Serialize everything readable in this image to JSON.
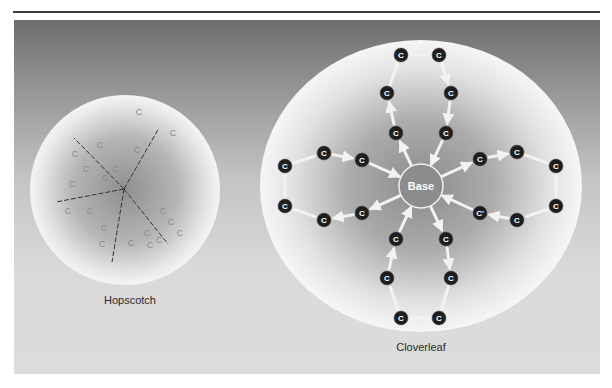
{
  "figure": {
    "panels": [
      {
        "id": "hopscotch",
        "label": "Hopscotch",
        "center": [
          125,
          190
        ],
        "radius": 95,
        "hub": [
          124,
          189
        ],
        "spokes": [
          [
            74,
            138
          ],
          [
            159,
            128
          ],
          [
            56,
            202
          ],
          [
            112,
            262
          ],
          [
            168,
            244
          ]
        ],
        "nodes": [
          {
            "x": 139,
            "y": 112,
            "t": "C"
          },
          {
            "x": 173,
            "y": 133,
            "t": "C"
          },
          {
            "x": 100,
            "y": 145,
            "t": "C"
          },
          {
            "x": 75,
            "y": 154,
            "t": "C"
          },
          {
            "x": 137,
            "y": 150,
            "t": "C"
          },
          {
            "x": 116,
            "y": 169,
            "t": "C"
          },
          {
            "x": 86,
            "y": 169,
            "t": "C"
          },
          {
            "x": 72,
            "y": 184,
            "t": "C"
          },
          {
            "x": 105,
            "y": 178,
            "t": "C"
          },
          {
            "x": 68,
            "y": 211,
            "t": "C"
          },
          {
            "x": 90,
            "y": 211,
            "t": "C"
          },
          {
            "x": 163,
            "y": 211,
            "t": "C"
          },
          {
            "x": 171,
            "y": 222,
            "t": "C"
          },
          {
            "x": 180,
            "y": 233,
            "t": "C"
          },
          {
            "x": 104,
            "y": 228,
            "t": "C"
          },
          {
            "x": 147,
            "y": 233,
            "t": "C"
          },
          {
            "x": 102,
            "y": 244,
            "t": "C"
          },
          {
            "x": 131,
            "y": 243,
            "t": "C"
          },
          {
            "x": 150,
            "y": 245,
            "t": "C"
          },
          {
            "x": 159,
            "y": 240,
            "t": "C"
          }
        ]
      },
      {
        "id": "cloverleaf",
        "label": "Cloverleaf",
        "center": [
          421,
          186
        ],
        "rx": 161,
        "ry": 146,
        "base": {
          "label": "Base",
          "x": 421,
          "y": 186,
          "r": 22
        },
        "nodes": [
          {
            "x": 401,
            "y": 55,
            "t": "C"
          },
          {
            "x": 439,
            "y": 55,
            "t": "C"
          },
          {
            "x": 387,
            "y": 93,
            "t": "C"
          },
          {
            "x": 451,
            "y": 93,
            "t": "C"
          },
          {
            "x": 396,
            "y": 133,
            "t": "C"
          },
          {
            "x": 446,
            "y": 133,
            "t": "C"
          },
          {
            "x": 285,
            "y": 166,
            "t": "C"
          },
          {
            "x": 324,
            "y": 153,
            "t": "C"
          },
          {
            "x": 362,
            "y": 160,
            "t": "C"
          },
          {
            "x": 285,
            "y": 206,
            "t": "C"
          },
          {
            "x": 324,
            "y": 220,
            "t": "C"
          },
          {
            "x": 362,
            "y": 213,
            "t": "C"
          },
          {
            "x": 480,
            "y": 159,
            "t": "C"
          },
          {
            "x": 517,
            "y": 152,
            "t": "C"
          },
          {
            "x": 556,
            "y": 166,
            "t": "C"
          },
          {
            "x": 480,
            "y": 213,
            "t": "C'"
          },
          {
            "x": 517,
            "y": 220,
            "t": "C"
          },
          {
            "x": 556,
            "y": 206,
            "t": "C"
          },
          {
            "x": 396,
            "y": 239,
            "t": "C"
          },
          {
            "x": 446,
            "y": 239,
            "t": "C"
          },
          {
            "x": 387,
            "y": 278,
            "t": "C"
          },
          {
            "x": 451,
            "y": 278,
            "t": "C"
          },
          {
            "x": 401,
            "y": 318,
            "t": "C"
          },
          {
            "x": 439,
            "y": 318,
            "t": "C"
          }
        ]
      }
    ]
  },
  "labels": {
    "hopscotch": "Hopscotch",
    "cloverleaf": "Cloverleaf"
  },
  "colors": {
    "node_fill": "#1e1e1e",
    "node_text": "#ffffff",
    "arrow": "#f2f2f2",
    "hop_letter": "#8a8a8a",
    "spoke": "#333333"
  }
}
